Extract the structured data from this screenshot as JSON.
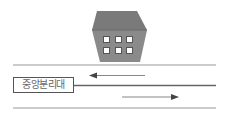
{
  "diagram": {
    "building": {
      "fill": "#8a8a8a",
      "top_fill": "#7a7a7a",
      "window_count": 6,
      "window_fill": "#ffffff"
    },
    "road": {
      "line_color": "#999999",
      "median_color": "#555555",
      "arrow_color": "#777777",
      "upper_lane_direction": "left",
      "lower_lane_direction": "right"
    },
    "median_label": "중앙분리대"
  }
}
